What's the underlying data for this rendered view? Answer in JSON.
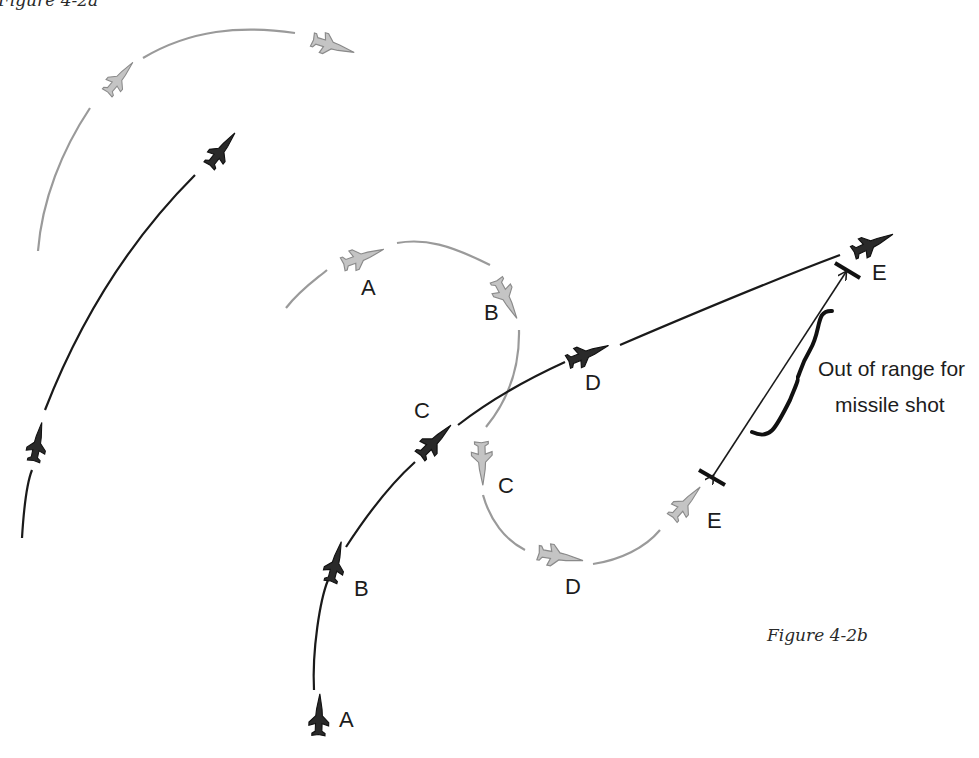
{
  "top_fragment": "Figure 4-2a",
  "caption": "Figure 4-2b",
  "annotation": {
    "line1": "Out of range for",
    "line2": "missile shot"
  },
  "colors": {
    "friendly_track": "#1a1a1a",
    "bandit_track": "#9a9a9a",
    "background": "#ffffff"
  },
  "upper_left_panel": {
    "description": "Carry-over from previous figure: gray arc and black arc with jet icons",
    "gray_jets": 2,
    "black_jets": 2
  },
  "labels": {
    "black": {
      "A": "A",
      "B": "B",
      "C": "C",
      "D": "D",
      "E": "E"
    },
    "gray": {
      "A": "A",
      "B": "B",
      "C": "C",
      "D": "D",
      "E": "E"
    }
  },
  "icons": {
    "jet": "fighter-jet-icon",
    "range_marker": "range-bar-icon",
    "brace": "curly-brace-icon",
    "double_arrow": "double-arrow-icon"
  }
}
